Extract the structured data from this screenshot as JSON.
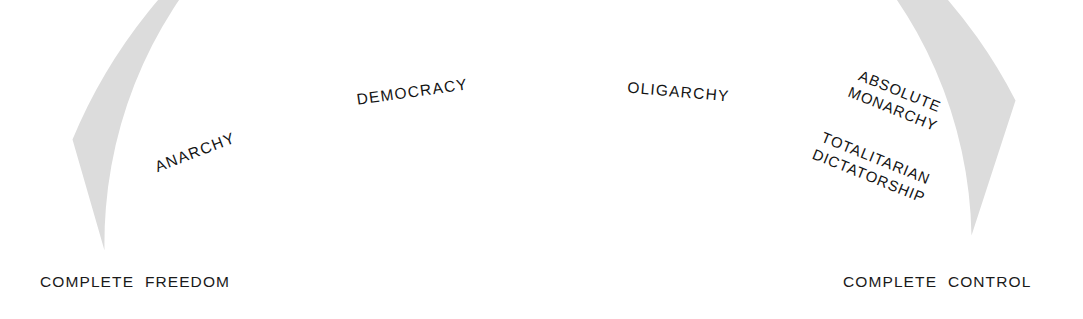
{
  "diagram": {
    "type": "arc-spectrum",
    "band_color": "#dcdcdc",
    "divider_color": "#8e8e8e",
    "text_color": "#141414",
    "background": "#ffffff",
    "segments": [
      {
        "id": "anarchy",
        "labels": [
          "ANARCHY"
        ],
        "order": 1
      },
      {
        "id": "democracy",
        "labels": [
          "DEMOCRACY"
        ],
        "order": 2
      },
      {
        "id": "oligarchy",
        "labels": [
          "OLIGARCHY"
        ],
        "order": 3
      },
      {
        "id": "absolute-monarchy-totalitarian-dictatorship",
        "labels": [
          "ABSOLUTE",
          "MONARCHY",
          "TOTALITARIAN",
          "DICTATORSHIP"
        ],
        "order": 4
      }
    ],
    "endpoints": {
      "left": "COMPLETE  FREEDOM",
      "right": "COMPLETE  CONTROL"
    },
    "segment_labels": {
      "anarchy": "ANARCHY",
      "democracy": "DEMOCRACY",
      "oligarchy": "OLIGARCHY",
      "absolute": "ABSOLUTE",
      "monarchy": "MONARCHY",
      "totalitarian": "TOTALITARIAN",
      "dictatorship": "DICTATORSHIP"
    }
  }
}
